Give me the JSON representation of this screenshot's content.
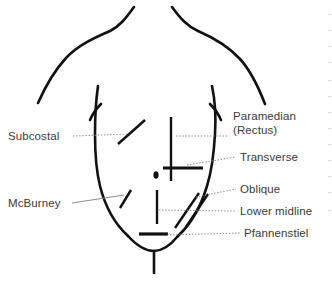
{
  "figure": {
    "background_color": "#ffffff",
    "line_color": "#111111",
    "leader_color": "#7a7a7a",
    "text_color": "#3a3a3a"
  },
  "labels": {
    "subcostal": "Subcostal",
    "mcburney": "McBurney",
    "paramedian_line1": "Paramedian",
    "paramedian_line2": "(Rectus)",
    "transverse": "Transverse",
    "oblique": "Oblique",
    "lower_midline": "Lower midline",
    "pfannenstiel": "Pfannenstiel"
  },
  "incisions": [
    {
      "name": "subcostal",
      "label": "Subcostal",
      "label_side": "left",
      "orientation": "oblique",
      "region": "right upper quadrant"
    },
    {
      "name": "paramedian-rectus",
      "label": "Paramedian (Rectus)",
      "label_side": "right",
      "orientation": "vertical",
      "region": "left paramedian upper abdomen"
    },
    {
      "name": "transverse",
      "label": "Transverse",
      "label_side": "right",
      "orientation": "horizontal",
      "region": "mid abdomen"
    },
    {
      "name": "mcburney",
      "label": "McBurney",
      "label_side": "left",
      "orientation": "oblique",
      "region": "right lower quadrant"
    },
    {
      "name": "oblique",
      "label": "Oblique",
      "label_side": "right",
      "orientation": "oblique",
      "region": "left lower quadrant"
    },
    {
      "name": "lower-midline",
      "label": "Lower midline",
      "label_side": "right",
      "orientation": "vertical",
      "region": "lower midline"
    },
    {
      "name": "pfannenstiel",
      "label": "Pfannenstiel",
      "label_side": "right",
      "orientation": "horizontal",
      "region": "suprapubic"
    }
  ],
  "anatomy": {
    "umbilicus": "umbilicus marker"
  }
}
